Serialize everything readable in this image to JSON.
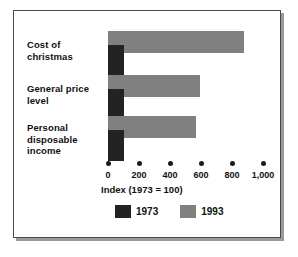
{
  "chart_data": {
    "type": "bar",
    "orientation": "horizontal",
    "title": "",
    "xlabel": "Index (1973 = 100)",
    "ylabel": "",
    "xlim": [
      0,
      1000
    ],
    "xticks": [
      0,
      200,
      400,
      600,
      800,
      1000
    ],
    "xtick_labels": [
      "0",
      "200",
      "400",
      "600",
      "800",
      "1,000"
    ],
    "grid": false,
    "legend_position": "bottom",
    "categories": [
      "Cost of christmas",
      "General price level",
      "Personal disposable income"
    ],
    "category_lines": [
      [
        "Cost of",
        "christmas"
      ],
      [
        "General price",
        "level"
      ],
      [
        "Personal",
        "disposable",
        "income"
      ]
    ],
    "series": [
      {
        "name": "1973",
        "color": "#232323",
        "values": [
          100,
          100,
          100
        ]
      },
      {
        "name": "1993",
        "color": "#808080",
        "values": [
          875,
          595,
          570
        ]
      }
    ]
  },
  "axis": {
    "title": "Index (1973 = 100)",
    "ticks": [
      {
        "value": 0,
        "label": "0"
      },
      {
        "value": 200,
        "label": "200"
      },
      {
        "value": 400,
        "label": "400"
      },
      {
        "value": 600,
        "label": "600"
      },
      {
        "value": 800,
        "label": "800"
      },
      {
        "value": 1000,
        "label": "1,000"
      }
    ]
  },
  "legend": {
    "items": [
      {
        "label": "1973",
        "color": "#232323"
      },
      {
        "label": "1993",
        "color": "#808080"
      }
    ]
  },
  "categories": [
    {
      "lines": [
        "Cost of",
        "christmas"
      ]
    },
    {
      "lines": [
        "General price",
        "level"
      ]
    },
    {
      "lines": [
        "Personal",
        "disposable",
        "income"
      ]
    }
  ],
  "colors": {
    "series_1973": "#232323",
    "series_1993": "#808080",
    "frame": "#4a4a4a",
    "background": "#ffffff",
    "text": "#111111"
  }
}
